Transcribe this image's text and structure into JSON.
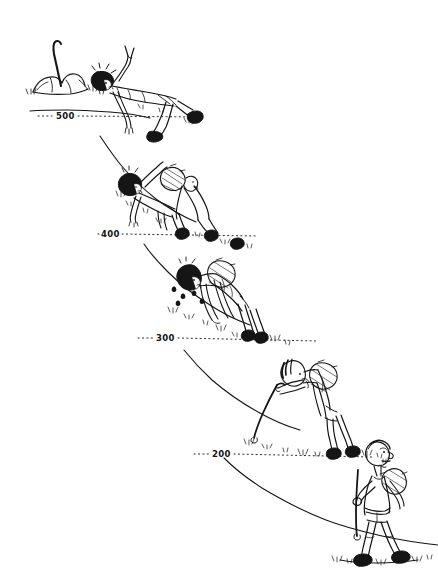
{
  "illustration": {
    "title": "Climber exhaustion sequence on a mountain slope",
    "background_color": "#ffffff",
    "ink_color": "#151515",
    "medium": "pen-and-ink cartoon line drawing",
    "width": 438,
    "height": 572
  },
  "altitude_markers": [
    {
      "id": "alt-500",
      "label": "500",
      "value": 500,
      "x": 56,
      "y": 112,
      "line_y": 116,
      "line_x_start": 40,
      "line_x_end": 200
    },
    {
      "id": "alt-400",
      "label": "400",
      "value": 400,
      "x": 101,
      "y": 230,
      "line_y": 234,
      "line_x_start": 85,
      "line_x_end": 250
    },
    {
      "id": "alt-300",
      "label": "300",
      "value": 300,
      "x": 156,
      "y": 334,
      "line_y": 338,
      "line_x_start": 140,
      "line_x_end": 310
    },
    {
      "id": "alt-200",
      "label": "200",
      "value": 200,
      "x": 212,
      "y": 450,
      "line_y": 454,
      "line_x_start": 196,
      "line_x_end": 368
    }
  ],
  "scene_elements": [
    {
      "id": "summit-cairn",
      "name": "rock cairn with planted stick",
      "description": "pile of rocks at the summit with a walking stick or ice axe planted in it",
      "altitude": 500
    },
    {
      "id": "figure-collapsed",
      "name": "collapsed climber",
      "description": "climber lying flat on their back on the summit ground, one arm raised making a victory sign, legs sprawled, completely spent",
      "altitude": 500,
      "pose": "lying down, arm raised in victory"
    },
    {
      "id": "figure-crawling-pair",
      "name": "crawling climbers",
      "description": "two climbers on hands and knees crawling up the slope, the rear one wearing a backpack, the front one reaching uphill",
      "altitude": 400,
      "pose": "crawling on all fours"
    },
    {
      "id": "figure-hunched",
      "name": "hunched climber",
      "description": "climber bent far forward with hands on knees, backpack on back, sweat drops flying off, gasping",
      "altitude": 300,
      "pose": "bent double, hands on knees"
    },
    {
      "id": "figure-leaning",
      "name": "climber leaning on stick",
      "description": "climber stooped forward leaning heavily on a long walking stick, backpack on back, tongue out, tired",
      "altitude": 200,
      "pose": "stooped, leaning on walking stick"
    },
    {
      "id": "figure-upright",
      "name": "fresh hiker striding",
      "description": "energetic hiker walking upright with a long stick and a small daypack, striding confidently at the start of the climb",
      "altitude": 200,
      "pose": "upright striding walk"
    }
  ],
  "caption": {
    "visible": false,
    "text": ""
  }
}
